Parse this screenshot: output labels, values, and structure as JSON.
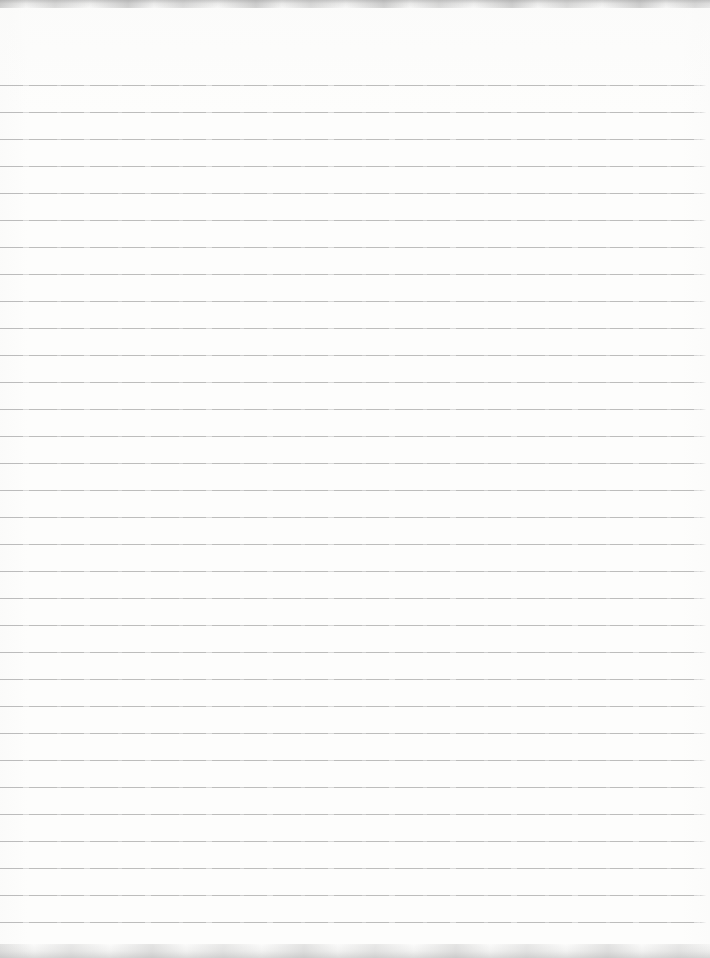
{
  "page": {
    "type": "scanned-notebook-paper",
    "content_text": "",
    "background_color": "#fdfdfc",
    "width_px": 710,
    "height_px": 958
  },
  "ruling": {
    "line_count": 32,
    "first_line_y_px": 85,
    "line_spacing_px": 27,
    "line_thickness_px": 1,
    "line_color": "#b2b2b2",
    "line_left_px": 0,
    "line_right_inset_px": 4
  },
  "scan_artifacts": {
    "top_edge": "mottled light gray scanner edge",
    "bottom_edge": "mottled light gray scanner edge",
    "top_edge_height_px": 8,
    "bottom_edge_height_px": 14,
    "edge_color": "#dcdcdc"
  }
}
